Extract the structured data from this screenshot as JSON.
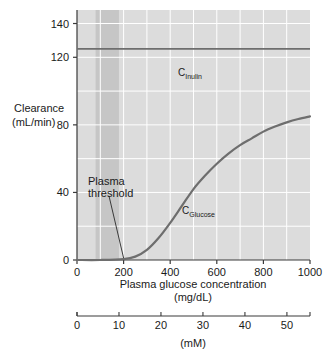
{
  "chart_data": {
    "type": "line",
    "title": "",
    "xlabel": "Plasma glucose concentration",
    "xunit": "(mg/dL)",
    "ylabel": "Clearance",
    "yunit": "(mL/min)",
    "xlim": [
      0,
      1000
    ],
    "ylim": [
      0,
      148
    ],
    "xticks": [
      0,
      200,
      400,
      600,
      800,
      1000
    ],
    "xticklabels": [
      "0",
      "200",
      "400",
      "600",
      "800",
      "1000"
    ],
    "yticks": [
      0,
      40,
      80,
      120,
      140
    ],
    "yticklabels": [
      "0",
      "40",
      "80",
      "120",
      "140"
    ],
    "grid": "white gridlines, vertical every 100 mg/dL, horizontal every 20 mL/min",
    "plot_background": "#dcdcdc",
    "legend": "inline series labels",
    "secondary_axis": {
      "label": "(mM)",
      "ticks": [
        0,
        10,
        20,
        30,
        40,
        50
      ],
      "ticklabels": [
        "0",
        "10",
        "20",
        "30",
        "40",
        "50"
      ],
      "max": 55.5,
      "conversion": "1 mM = 18 mg/dL"
    },
    "shaded_band": {
      "name": "normal plasma glucose range",
      "x_start": 80,
      "x_end": 180,
      "color": "#c8c8c8"
    },
    "annotations": [
      {
        "name": "plasma-threshold",
        "text_line1": "Plasma",
        "text_line2": "threshold",
        "points_to_x": 200,
        "points_to_y": 0
      }
    ],
    "series": [
      {
        "name": "C_Inulin",
        "label_main": "C",
        "label_sub": "Inulin",
        "color": "#6e6e6e",
        "constant_value": 125,
        "x": [
          0,
          100,
          200,
          300,
          400,
          500,
          600,
          700,
          800,
          900,
          1000
        ],
        "values": [
          125,
          125,
          125,
          125,
          125,
          125,
          125,
          125,
          125,
          125,
          125
        ]
      },
      {
        "name": "C_Glucose",
        "label_main": "C",
        "label_sub": "Glucose",
        "color": "#6e6e6e",
        "x": [
          0,
          100,
          200,
          250,
          300,
          350,
          400,
          450,
          500,
          550,
          600,
          650,
          700,
          750,
          800,
          850,
          900,
          950,
          1000
        ],
        "values": [
          0,
          0,
          0.5,
          2,
          6,
          13,
          22,
          32,
          42,
          50,
          57,
          63,
          68,
          72,
          76,
          79,
          81.5,
          83.5,
          85
        ]
      }
    ]
  },
  "labels": {
    "y_axis_line1": "Clearance",
    "y_axis_line2": "(mL/min)",
    "x_axis_line1": "Plasma glucose concentration",
    "x_axis_line2": "(mg/dL)",
    "mm_axis": "(mM)"
  }
}
